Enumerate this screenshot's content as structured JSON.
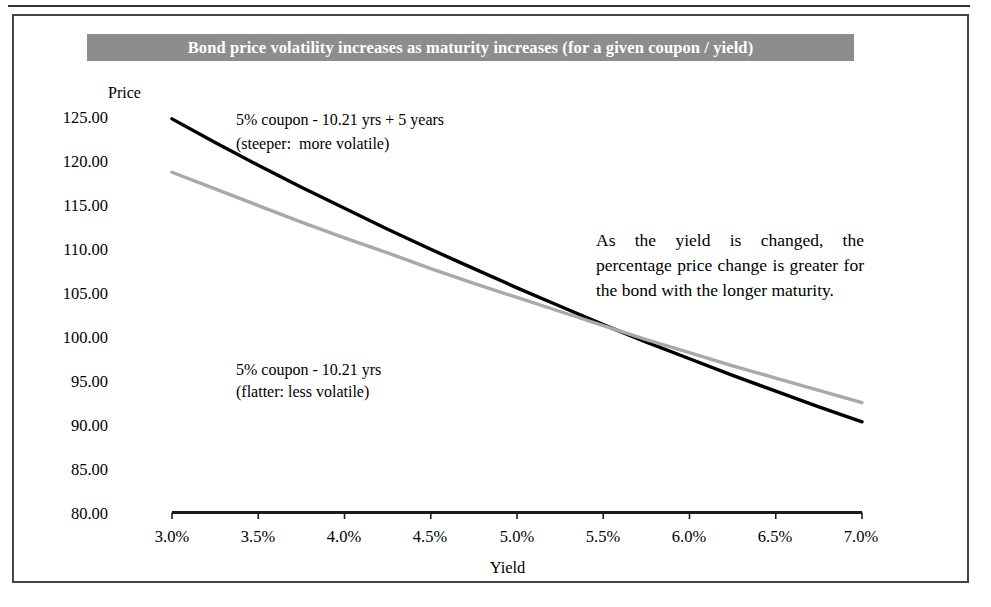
{
  "title": "Bond price volatility increases as maturity increases (for a given coupon / yield)",
  "axis_title_y": "Price",
  "axis_title_x": "Yield",
  "annotations": {
    "steep_line1": "5% coupon - 10.21 yrs + 5 years",
    "steep_line2": "(steeper:  more volatile)",
    "flat_line1": "5% coupon - 10.21 yrs",
    "flat_line2": "(flatter: less volatile)",
    "note": "As the yield is changed, the percentage price change is greater for the bond with the longer maturity."
  },
  "colors": {
    "banner_bg": "#8d8d8d",
    "banner_text": "#ffffff",
    "long_maturity_line": "#000000",
    "short_maturity_line": "#a9a9a9",
    "axis": "#1a1a1a",
    "frame": "#444444"
  },
  "chart_data": {
    "type": "line",
    "title": "Bond price volatility increases as maturity increases (for a given coupon / yield)",
    "xlabel": "Yield",
    "ylabel": "Price",
    "xlim": [
      3.0,
      7.0
    ],
    "ylim": [
      80.0,
      125.0
    ],
    "grid": false,
    "legend": "none (inline annotations)",
    "x_tick_labels": [
      "3.0%",
      "3.5%",
      "4.0%",
      "4.5%",
      "5.0%",
      "5.5%",
      "6.0%",
      "6.5%",
      "7.0%"
    ],
    "y_tick_labels": [
      "125.00",
      "120.00",
      "115.00",
      "110.00",
      "105.00",
      "100.00",
      "95.00",
      "90.00",
      "85.00",
      "80.00"
    ],
    "x": [
      3.0,
      3.25,
      3.5,
      3.75,
      4.0,
      4.25,
      4.5,
      4.75,
      5.0,
      5.25,
      5.5,
      5.75,
      6.0,
      6.25,
      6.5,
      6.75,
      7.0
    ],
    "series": [
      {
        "name": "5% coupon - 10.21 yrs + 5 years",
        "note": "steeper: more volatile",
        "color": "#000000",
        "values": [
          124.9,
          122.2,
          119.6,
          117.1,
          114.7,
          112.3,
          110.0,
          107.8,
          105.6,
          103.5,
          101.4,
          99.4,
          97.5,
          95.6,
          93.8,
          92.0,
          90.3
        ]
      },
      {
        "name": "5% coupon - 10.21 yrs",
        "note": "flatter: less volatile",
        "color": "#a9a9a9",
        "values": [
          118.8,
          116.9,
          115.0,
          113.1,
          111.3,
          109.6,
          107.8,
          106.1,
          104.5,
          102.9,
          101.3,
          99.7,
          98.2,
          96.7,
          95.3,
          93.9,
          92.5
        ]
      }
    ],
    "crossover": {
      "yield": 5.15,
      "price": 100.0
    }
  }
}
